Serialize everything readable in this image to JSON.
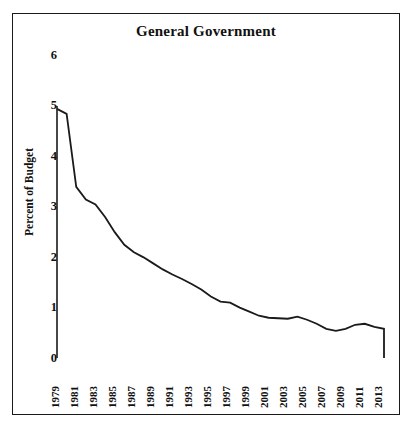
{
  "chart_data": {
    "type": "line",
    "title": "General Government",
    "xlabel": "",
    "ylabel": "Percent of Budget",
    "ylim": [
      0,
      6
    ],
    "xlim": [
      1979,
      2013
    ],
    "yticks": [
      "0",
      "1",
      "2",
      "3",
      "4",
      "5",
      "6"
    ],
    "ytick_values": [
      0,
      1,
      2,
      3,
      4,
      5,
      6
    ],
    "xticks": [
      "1979",
      "1981",
      "1983",
      "1985",
      "1987",
      "1989",
      "1991",
      "1993",
      "1995",
      "1997",
      "1999",
      "2001",
      "2003",
      "2005",
      "2007",
      "2009",
      "2011",
      "2013"
    ],
    "xtick_values": [
      1979,
      1981,
      1983,
      1985,
      1987,
      1989,
      1991,
      1993,
      1995,
      1997,
      1999,
      2001,
      2003,
      2005,
      2007,
      2009,
      2011,
      2013
    ],
    "grid": false,
    "legend": null,
    "line_color": "#1a1a1a",
    "series": [
      {
        "name": "General Government",
        "x": [
          1979,
          1980,
          1981,
          1982,
          1983,
          1984,
          1985,
          1986,
          1987,
          1988,
          1989,
          1990,
          1991,
          1992,
          1993,
          1994,
          1995,
          1996,
          1997,
          1998,
          1999,
          2000,
          2001,
          2002,
          2003,
          2004,
          2005,
          2006,
          2007,
          2008,
          2009,
          2010,
          2011,
          2012,
          2013,
          2013
        ],
        "values": [
          4.95,
          4.85,
          3.4,
          3.15,
          3.05,
          2.8,
          2.5,
          2.25,
          2.1,
          2.0,
          1.88,
          1.76,
          1.66,
          1.57,
          1.47,
          1.36,
          1.22,
          1.12,
          1.1,
          1.0,
          0.92,
          0.84,
          0.8,
          0.79,
          0.78,
          0.82,
          0.76,
          0.68,
          0.58,
          0.54,
          0.58,
          0.66,
          0.68,
          0.62,
          0.58,
          0.0
        ]
      }
    ]
  }
}
